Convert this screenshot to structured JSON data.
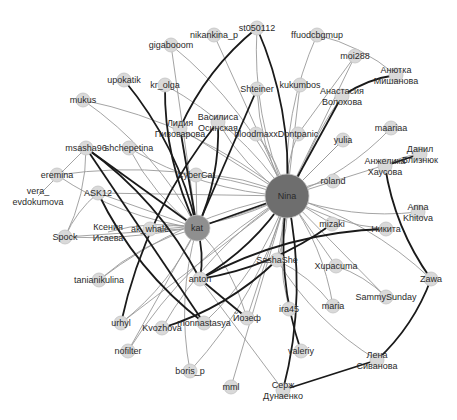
{
  "graph": {
    "title": "Social network graph",
    "colors": {
      "background": "#ffffff",
      "node_fill": "#d9d9d9",
      "node_stroke": "#c4c4c4",
      "hub_fill": "#6e6e6e",
      "hub2_fill": "#8f8f8f",
      "edge_light": "#9a9a9a",
      "edge_dark": "#1a1a1a",
      "label": "#2a2a2a"
    },
    "nodes": [
      {
        "id": "Nina",
        "label": "Nina",
        "x": 287,
        "y": 196,
        "r": 22,
        "type": "hub"
      },
      {
        "id": "kat",
        "label": "kat",
        "x": 197,
        "y": 228,
        "r": 13,
        "type": "hub2"
      },
      {
        "id": "st050112",
        "label": "st050112",
        "x": 257,
        "y": 28,
        "r": 7
      },
      {
        "id": "nikankina_p",
        "label": "nikankina_p",
        "x": 214,
        "y": 35,
        "r": 7
      },
      {
        "id": "gigabooom",
        "label": "gigabooom",
        "x": 171,
        "y": 45,
        "r": 7
      },
      {
        "id": "ffuodcbgmup",
        "label": "ffuodcbgmup",
        "x": 317,
        "y": 35,
        "r": 7
      },
      {
        "id": "moi288",
        "label": "moi288",
        "x": 355,
        "y": 56,
        "r": 7
      },
      {
        "id": "Anotka",
        "label1": "Анютка",
        "label2": "Мишанова",
        "x": 396,
        "y": 75,
        "r": 7
      },
      {
        "id": "upokatik",
        "label": "upokatik",
        "x": 124,
        "y": 80,
        "r": 7
      },
      {
        "id": "kr_olga",
        "label": "kr_olga",
        "x": 165,
        "y": 85,
        "r": 7
      },
      {
        "id": "Shteiner",
        "label": "Shteiner",
        "x": 257,
        "y": 89,
        "r": 7
      },
      {
        "id": "kukumbos",
        "label": "kukumbos",
        "x": 300,
        "y": 85,
        "r": 7
      },
      {
        "id": "Anastasia",
        "label1": "Анастасия",
        "label2": "Волохова",
        "x": 342,
        "y": 96,
        "r": 7
      },
      {
        "id": "mukus",
        "label": "mukus",
        "x": 83,
        "y": 100,
        "r": 7
      },
      {
        "id": "Vasilisa",
        "label1": "Василиса",
        "label2": "Осинская",
        "x": 218,
        "y": 122,
        "r": 7
      },
      {
        "id": "Lidia",
        "label1": "Лидия",
        "label2": "Пивоварова",
        "x": 180,
        "y": 128,
        "r": 7
      },
      {
        "id": "bloodmaxx",
        "label": "bloodmaxx",
        "x": 256,
        "y": 134,
        "r": 7
      },
      {
        "id": "Dontpanic",
        "label": "Dontpanic",
        "x": 298,
        "y": 134,
        "r": 7
      },
      {
        "id": "yulia",
        "label": "yulia",
        "x": 343,
        "y": 140,
        "r": 7
      },
      {
        "id": "maariaa",
        "label": "maariaa",
        "x": 391,
        "y": 128,
        "r": 7
      },
      {
        "id": "msasha96",
        "label": "msasha96",
        "x": 86,
        "y": 148,
        "r": 7
      },
      {
        "id": "shchepetina",
        "label": "shchepetina",
        "x": 129,
        "y": 148,
        "r": 7
      },
      {
        "id": "Daniil",
        "label1": "Данил",
        "label2": "Близнюк",
        "x": 420,
        "y": 154,
        "r": 7
      },
      {
        "id": "Anzhelika",
        "label1": "Анжелика",
        "label2": "Хаусова",
        "x": 385,
        "y": 166,
        "r": 7
      },
      {
        "id": "CyberCat",
        "label": "CyberCat",
        "x": 196,
        "y": 175,
        "r": 7
      },
      {
        "id": "eremina",
        "label": "eremina",
        "x": 57,
        "y": 175,
        "r": 7
      },
      {
        "id": "roland",
        "label": "roland",
        "x": 333,
        "y": 181,
        "r": 7
      },
      {
        "id": "ASK12",
        "label": "ASK12",
        "x": 98,
        "y": 193,
        "r": 7
      },
      {
        "id": "vera",
        "label1": "vera_",
        "label2": "evdokumova",
        "x": 38,
        "y": 196,
        "r": 0
      },
      {
        "id": "AnnaKhitova",
        "label1": "Anna",
        "label2": "Khitova",
        "x": 418,
        "y": 212,
        "r": 7
      },
      {
        "id": "Kseniya",
        "label1": "Ксения",
        "label2": "Исаева",
        "x": 108,
        "y": 232,
        "r": 0
      },
      {
        "id": "ak_whale",
        "label": "ak_whale",
        "x": 150,
        "y": 229,
        "r": 7
      },
      {
        "id": "Spock",
        "label": "Spock",
        "x": 65,
        "y": 237,
        "r": 7
      },
      {
        "id": "mizaki",
        "label": "mizaki",
        "x": 332,
        "y": 224,
        "r": 7
      },
      {
        "id": "Nikita",
        "label": "Никита",
        "x": 386,
        "y": 229,
        "r": 7
      },
      {
        "id": "SashaShe",
        "label": "SashaShe",
        "x": 277,
        "y": 260,
        "r": 7
      },
      {
        "id": "Xupacuma",
        "label": "Xupacuma",
        "x": 336,
        "y": 266,
        "r": 7
      },
      {
        "id": "tanianikulina",
        "label": "tanianikulina",
        "x": 99,
        "y": 280,
        "r": 7
      },
      {
        "id": "anton",
        "label": "anton",
        "x": 200,
        "y": 279,
        "r": 7
      },
      {
        "id": "Zawa",
        "label": "Zawa",
        "x": 431,
        "y": 279,
        "r": 7
      },
      {
        "id": "SammySunday",
        "label": "SammySunday",
        "x": 386,
        "y": 297,
        "r": 7
      },
      {
        "id": "ira45",
        "label": "ira45",
        "x": 289,
        "y": 309,
        "r": 7
      },
      {
        "id": "maria",
        "label": "maria",
        "x": 333,
        "y": 306,
        "r": 7
      },
      {
        "id": "urhyl",
        "label": "urhyl",
        "x": 121,
        "y": 323,
        "r": 7
      },
      {
        "id": "Kvozhova",
        "label": "Kvozhova",
        "x": 162,
        "y": 328,
        "r": 7
      },
      {
        "id": "monnastasya",
        "label": "monnastasya",
        "x": 204,
        "y": 323,
        "r": 7
      },
      {
        "id": "Yozef",
        "label": "Йозеф",
        "x": 247,
        "y": 318,
        "r": 7
      },
      {
        "id": "valeriy",
        "label": "valeriy",
        "x": 301,
        "y": 351,
        "r": 7
      },
      {
        "id": "Lena",
        "label1": "Лена",
        "label2": "Сиванова",
        "x": 377,
        "y": 360,
        "r": 7
      },
      {
        "id": "nofilter",
        "label": "nofilter",
        "x": 128,
        "y": 351,
        "r": 7
      },
      {
        "id": "boris_p",
        "label": "boris_p",
        "x": 190,
        "y": 371,
        "r": 7
      },
      {
        "id": "mml",
        "label": "mml",
        "x": 231,
        "y": 387,
        "r": 7
      },
      {
        "id": "Serzh",
        "label1": "Серж",
        "label2": "Дунаенко",
        "x": 283,
        "y": 390,
        "r": 7
      }
    ],
    "edges_light": [
      [
        "Nina",
        "st050112"
      ],
      [
        "Nina",
        "nikankina_p"
      ],
      [
        "Nina",
        "gigabooom"
      ],
      [
        "Nina",
        "ffuodcbgmup"
      ],
      [
        "Nina",
        "moi288"
      ],
      [
        "Nina",
        "kr_olga"
      ],
      [
        "Nina",
        "Shteiner"
      ],
      [
        "Nina",
        "kukumbos"
      ],
      [
        "Nina",
        "mukus"
      ],
      [
        "Nina",
        "Vasilisa"
      ],
      [
        "Nina",
        "Lidia"
      ],
      [
        "Nina",
        "bloodmaxx"
      ],
      [
        "Nina",
        "Dontpanic"
      ],
      [
        "Nina",
        "yulia"
      ],
      [
        "Nina",
        "maariaa"
      ],
      [
        "Nina",
        "shchepetina"
      ],
      [
        "Nina",
        "Daniil"
      ],
      [
        "Nina",
        "CyberCat"
      ],
      [
        "Nina",
        "roland"
      ],
      [
        "Nina",
        "ASK12"
      ],
      [
        "Nina",
        "AnnaKhitova"
      ],
      [
        "Nina",
        "ak_whale"
      ],
      [
        "Nina",
        "mizaki"
      ],
      [
        "Nina",
        "Nikita"
      ],
      [
        "Nina",
        "SashaShe"
      ],
      [
        "Nina",
        "Xupacuma"
      ],
      [
        "Nina",
        "tanianikulina"
      ],
      [
        "Nina",
        "Zawa"
      ],
      [
        "Nina",
        "SammySunday"
      ],
      [
        "Nina",
        "ira45"
      ],
      [
        "Nina",
        "maria"
      ],
      [
        "Nina",
        "urhyl"
      ],
      [
        "Nina",
        "Kvozhova"
      ],
      [
        "Nina",
        "monnastasya"
      ],
      [
        "Nina",
        "Yozef"
      ],
      [
        "Nina",
        "nofilter"
      ],
      [
        "Nina",
        "boris_p"
      ],
      [
        "Nina",
        "mml"
      ],
      [
        "Nina",
        "eremina"
      ],
      [
        "Nina",
        "Spock"
      ],
      [
        "kat",
        "gigabooom"
      ],
      [
        "kat",
        "mukus"
      ],
      [
        "kat",
        "shchepetina"
      ],
      [
        "kat",
        "ASK12"
      ],
      [
        "kat",
        "ak_whale"
      ],
      [
        "kat",
        "eremina"
      ],
      [
        "kat",
        "Spock"
      ],
      [
        "kat",
        "tanianikulina"
      ],
      [
        "kat",
        "urhyl"
      ],
      [
        "kat",
        "nofilter"
      ],
      [
        "kat",
        "boris_p"
      ],
      [
        "kat",
        "Yozef"
      ],
      [
        "kat",
        "CyberCat"
      ],
      [
        "kat",
        "Kseniya"
      ],
      [
        "msasha96",
        "Spock"
      ],
      [
        "msasha96",
        "vera"
      ],
      [
        "ASK12",
        "Spock"
      ],
      [
        "ffuodcbgmup",
        "Anotka"
      ],
      [
        "moi288",
        "Dontpanic"
      ],
      [
        "Anastasia",
        "SashaShe"
      ],
      [
        "Anzhelika",
        "Daniil"
      ],
      [
        "yulia",
        "Nina"
      ],
      [
        "SammySunday",
        "Xupacuma"
      ],
      [
        "Lena",
        "SashaShe"
      ],
      [
        "Serzh",
        "anton"
      ],
      [
        "maria",
        "SashaShe"
      ]
    ],
    "edges_dark": [
      [
        "Nina",
        "kat"
      ],
      [
        "Nina",
        "st050112"
      ],
      [
        "Nina",
        "anton"
      ],
      [
        "Nina",
        "Anastasia"
      ],
      [
        "Nina",
        "valeriy"
      ],
      [
        "Nina",
        "Serzh"
      ],
      [
        "kat",
        "msasha96"
      ],
      [
        "kat",
        "upokatik"
      ],
      [
        "kat",
        "kr_olga"
      ],
      [
        "kat",
        "Lidia"
      ],
      [
        "kat",
        "Vasilisa"
      ],
      [
        "kat",
        "anton"
      ],
      [
        "kat",
        "Shteiner"
      ],
      [
        "st050112",
        "Lidia"
      ],
      [
        "Anastasia",
        "Anotka"
      ],
      [
        "Anzhelika",
        "Daniil"
      ],
      [
        "Anzhelika",
        "Zawa"
      ],
      [
        "Zawa",
        "Lena"
      ],
      [
        "Lena",
        "Serzh"
      ],
      [
        "Nikita",
        "anton"
      ],
      [
        "msasha96",
        "anton"
      ],
      [
        "monnastasya",
        "msasha96"
      ],
      [
        "Kvozhova",
        "SashaShe"
      ],
      [
        "mizaki",
        "anton"
      ],
      [
        "Yozef",
        "anton"
      ],
      [
        "ASK12",
        "monnastasya"
      ],
      [
        "urhyl",
        "Vasilisa"
      ]
    ]
  }
}
